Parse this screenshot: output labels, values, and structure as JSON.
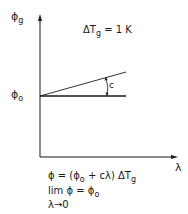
{
  "diagram": {
    "y_axis_label": {
      "symbol": "ϕ",
      "subscript": "g"
    },
    "x_axis_label": "λ",
    "origin_label": {
      "symbol": "ϕ",
      "subscript": "o"
    },
    "condition": {
      "prefix": "ΔT",
      "subscript": "g",
      "suffix": " = 1 K"
    },
    "slope_label": "c",
    "lines": [
      {
        "name": "sloped-line",
        "from": [
          0,
          0
        ],
        "to": [
          1,
          "c"
        ]
      },
      {
        "name": "baseline",
        "from": [
          0,
          0
        ],
        "to": [
          1,
          0
        ]
      }
    ],
    "equations": {
      "line1": {
        "main": "ϕ = (ϕ",
        "sub1": "o",
        "mid": " + cλ) ΔT",
        "sub2": "g"
      },
      "line2": {
        "main": "lim  ϕ =  ϕ",
        "sub": "o"
      },
      "line3": "λ→0"
    }
  },
  "colors": {
    "ink": "#1a1a1a",
    "background": "#ffffff"
  }
}
